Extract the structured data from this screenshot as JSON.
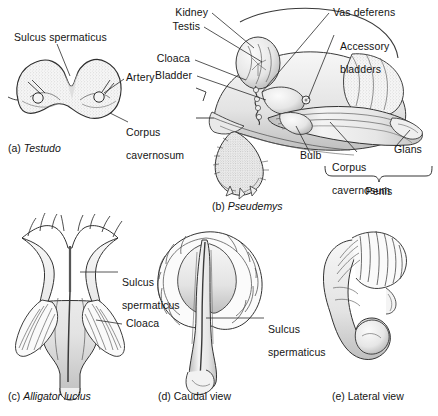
{
  "figure": {
    "panels": [
      {
        "id": "a",
        "tag": "(a)",
        "caption": "Testudo",
        "caption_italic": true,
        "view": "cross-section of penis",
        "labels": [
          {
            "name": "sulcus-spermaticus",
            "text": "Sulcus spermaticus"
          },
          {
            "name": "artery",
            "text": "Artery"
          },
          {
            "name": "corpus-cavernosum",
            "text": "Corpus\ncavernosum"
          }
        ]
      },
      {
        "id": "b",
        "tag": "(b)",
        "caption": "Pseudemys",
        "caption_italic": true,
        "view": "sagittal dissection of male turtle",
        "labels": [
          {
            "name": "kidney",
            "text": "Kidney"
          },
          {
            "name": "testis",
            "text": "Testis"
          },
          {
            "name": "cloaca",
            "text": "Cloaca"
          },
          {
            "name": "bladder",
            "text": "Bladder"
          },
          {
            "name": "vas-deferens",
            "text": "Vas deferens"
          },
          {
            "name": "accessory-bladders",
            "text": "Accessory\nbladders"
          },
          {
            "name": "bulb",
            "text": "Bulb"
          },
          {
            "name": "corpus-cavernosum",
            "text": "Corpus\ncavernosum"
          },
          {
            "name": "glans",
            "text": "Glans"
          },
          {
            "name": "penis-bracket",
            "text": "Penis"
          }
        ]
      },
      {
        "id": "c",
        "tag": "(c)",
        "caption": "Alligator lucius",
        "caption_italic": true,
        "view": "ventral view of cloacal region",
        "labels": [
          {
            "name": "sulcus-spermaticus",
            "text": "Sulcus\nspermaticus"
          },
          {
            "name": "cloaca",
            "text": "Cloaca"
          }
        ]
      },
      {
        "id": "d",
        "tag": "(d)",
        "caption": "Caudal view",
        "caption_italic": false,
        "view": "caudal view of penis",
        "labels": [
          {
            "name": "sulcus-spermaticus",
            "text": "Sulcus\nspermaticus"
          }
        ]
      },
      {
        "id": "e",
        "tag": "(e)",
        "caption": "Lateral view",
        "caption_italic": false,
        "view": "lateral view of penis",
        "labels": []
      }
    ],
    "text": {
      "a_sulcus": "Sulcus spermaticus",
      "a_artery": "Artery",
      "a_corpus_l1": "Corpus",
      "a_corpus_l2": "cavernosum",
      "a_tag": "(a)",
      "a_caption": "Testudo",
      "b_kidney": "Kidney",
      "b_testis": "Testis",
      "b_cloaca": "Cloaca",
      "b_bladder": "Bladder",
      "b_vas_deferens": "Vas deferens",
      "b_accessory_l1": "Accessory",
      "b_accessory_l2": "bladders",
      "b_bulb": "Bulb",
      "b_corpus_l1": "Corpus",
      "b_corpus_l2": "cavernosum",
      "b_glans": "Glans",
      "b_penis": "Penis",
      "b_tag": "(b)",
      "b_caption": "Pseudemys",
      "c_sulcus_l1": "Sulcus",
      "c_sulcus_l2": "spermaticus",
      "c_cloaca": "Cloaca",
      "c_tag": "(c)",
      "c_caption": "Alligator lucius",
      "d_sulcus_l1": "Sulcus",
      "d_sulcus_l2": "spermaticus",
      "d_tag": "(d)",
      "d_caption": "Caudal view",
      "e_tag": "(e)",
      "e_caption": "Lateral view"
    },
    "colors": {
      "background": "#ffffff",
      "ink": "#141414",
      "line": "#333333",
      "fill_light": "#f2f2f2",
      "fill_mid": "#e2e2e2",
      "fill_dark": "#cfcfcf"
    }
  }
}
